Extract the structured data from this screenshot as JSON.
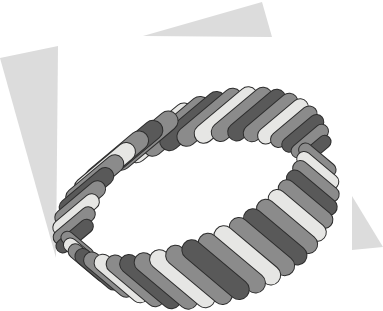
{
  "artwork": {
    "title": "Woven Capsule Ring",
    "description": "Perspective view of a closed band formed from overlapping capsule (stadium) shapes woven in alternating light, medium and dark grey tones.",
    "canvas": {
      "width": 383,
      "height": 311,
      "background": "#ffffff"
    },
    "palette": {
      "background": "#ffffff",
      "capsule_light": "#e6e6e4",
      "capsule_medium": "#8b8b8b",
      "capsule_dark": "#595959",
      "capsule_outline": "#2e2e2e",
      "triangle_fill": "#dcdcdc"
    },
    "ring": {
      "center_x": 196,
      "center_y": 175,
      "radius_x": 128,
      "radius_y": 74,
      "tilt_degrees": -22,
      "band_depth": 46,
      "capsule_count": 46,
      "capsule_length": 62,
      "capsule_thickness": 19,
      "capsule_tilt_degrees": 62,
      "tone_sequence": [
        "dark",
        "medium",
        "light",
        "medium"
      ]
    },
    "background_shapes": [
      {
        "name": "triangle-top",
        "points": "143,36 262,2 272,37",
        "fill": "#dcdcdc"
      },
      {
        "name": "triangle-left",
        "points": "0,58 58,46 56,258",
        "fill": "#dcdcdc"
      },
      {
        "name": "triangle-right",
        "points": "352,196 383,247 352,250",
        "fill": "#dcdcdc"
      }
    ]
  }
}
